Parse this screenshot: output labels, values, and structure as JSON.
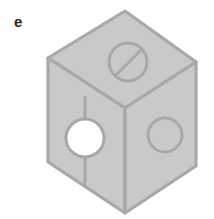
{
  "figure": {
    "label": "e",
    "canvas": {
      "width": 214,
      "height": 219,
      "background": "#ffffff"
    },
    "colors": {
      "face_fill": "#c9c9c9",
      "face_outline": "#a8a8a8",
      "feature_outline": "#a8a8a8",
      "hole_fill": "#ffffff",
      "label_color": "#262626"
    },
    "stroke_widths": {
      "body_outline": 3.2,
      "internal_edge": 3.2,
      "feature_circle": 3.0,
      "slot_line": 3.0,
      "groove_line": 3.0
    },
    "geometry": {
      "top_apex": {
        "x": 125,
        "y": 11
      },
      "left_upper": {
        "x": 48,
        "y": 58
      },
      "right_upper": {
        "x": 196,
        "y": 62
      },
      "center_vertex": {
        "x": 125,
        "y": 108
      },
      "left_lower": {
        "x": 48,
        "y": 162
      },
      "right_lower": {
        "x": 196,
        "y": 166
      },
      "bottom_apex": {
        "x": 125,
        "y": 213
      }
    },
    "features": [
      {
        "name": "top-face-slotted-circle",
        "face": "top",
        "type": "circle-with-slot",
        "center": {
          "x": 128,
          "y": 62
        },
        "radius_x": 19,
        "radius_y": 19,
        "filled": false,
        "slot": {
          "x1": 115,
          "y1": 76,
          "x2": 142,
          "y2": 49
        }
      },
      {
        "name": "left-face-through-hole",
        "face": "left",
        "type": "circle",
        "center": {
          "x": 85,
          "y": 138
        },
        "radius_x": 19,
        "radius_y": 19,
        "filled": true,
        "fill": "#ffffff"
      },
      {
        "name": "right-face-circle",
        "face": "right",
        "type": "circle",
        "center": {
          "x": 165,
          "y": 135
        },
        "radius_x": 17,
        "radius_y": 17,
        "filled": false
      },
      {
        "name": "left-face-vertical-groove",
        "face": "left",
        "type": "line",
        "x1": 85,
        "y1": 100,
        "x2": 85,
        "y2": 186
      }
    ]
  }
}
